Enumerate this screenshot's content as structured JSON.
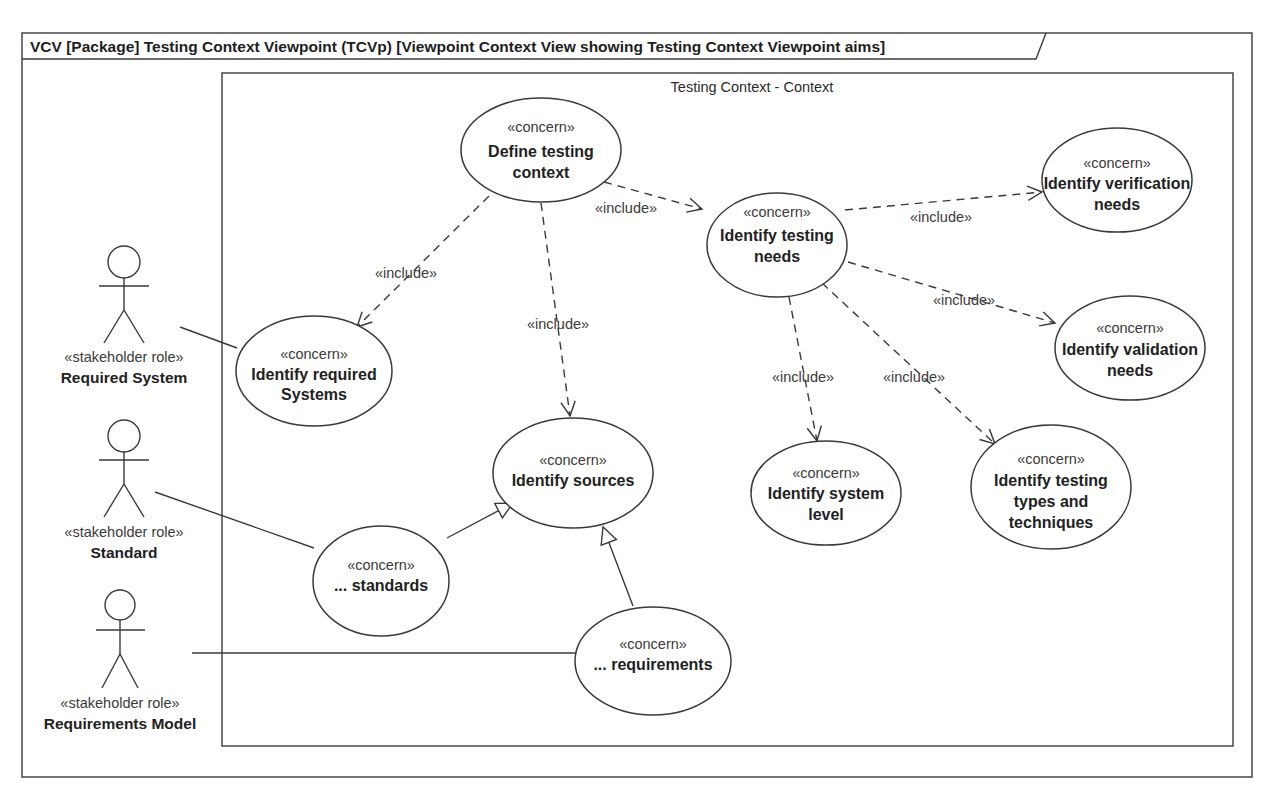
{
  "frame": {
    "title": "VCV [Package] Testing Context Viewpoint (TCVp) [Viewpoint Context View showing Testing Context Viewpoint aims]"
  },
  "boundary": {
    "title": "Testing Context - Context"
  },
  "stereotypes": {
    "concern": "«concern»",
    "stakeholder_role": "«stakeholder role»",
    "include": "«include»"
  },
  "actors": [
    {
      "id": "required-system",
      "stereotype": "«stakeholder role»",
      "name": "Required System"
    },
    {
      "id": "standard",
      "stereotype": "«stakeholder role»",
      "name": "Standard"
    },
    {
      "id": "requirements-model",
      "stereotype": "«stakeholder role»",
      "name": "Requirements Model"
    }
  ],
  "concerns": [
    {
      "id": "define-testing-context",
      "stereotype": "«concern»",
      "lines": [
        "Define testing",
        "context"
      ]
    },
    {
      "id": "identify-testing-needs",
      "stereotype": "«concern»",
      "lines": [
        "Identify testing",
        "needs"
      ]
    },
    {
      "id": "identify-verification-needs",
      "stereotype": "«concern»",
      "lines": [
        "Identify verification",
        "needs"
      ]
    },
    {
      "id": "identify-validation-needs",
      "stereotype": "«concern»",
      "lines": [
        "Identify validation",
        "needs"
      ]
    },
    {
      "id": "identify-required-systems",
      "stereotype": "«concern»",
      "lines": [
        "Identify required",
        "Systems"
      ]
    },
    {
      "id": "identify-sources",
      "stereotype": "«concern»",
      "lines": [
        "Identify sources"
      ]
    },
    {
      "id": "identify-system-level",
      "stereotype": "«concern»",
      "lines": [
        "Identify system",
        "level"
      ]
    },
    {
      "id": "identify-testing-types",
      "stereotype": "«concern»",
      "lines": [
        "Identify testing",
        "types and",
        "techniques"
      ]
    },
    {
      "id": "standards",
      "stereotype": "«concern»",
      "lines": [
        "... standards"
      ]
    },
    {
      "id": "requirements",
      "stereotype": "«concern»",
      "lines": [
        "... requirements"
      ]
    }
  ],
  "relationships": [
    {
      "type": "include",
      "from": "define-testing-context",
      "to": "identify-testing-needs",
      "label": "«include»"
    },
    {
      "type": "include",
      "from": "define-testing-context",
      "to": "identify-required-systems",
      "label": "«include»"
    },
    {
      "type": "include",
      "from": "define-testing-context",
      "to": "identify-sources",
      "label": "«include»"
    },
    {
      "type": "include",
      "from": "identify-testing-needs",
      "to": "identify-verification-needs",
      "label": "«include»"
    },
    {
      "type": "include",
      "from": "identify-testing-needs",
      "to": "identify-validation-needs",
      "label": "«include»"
    },
    {
      "type": "include",
      "from": "identify-testing-needs",
      "to": "identify-system-level",
      "label": "«include»"
    },
    {
      "type": "include",
      "from": "identify-testing-needs",
      "to": "identify-testing-types",
      "label": "«include»"
    },
    {
      "type": "generalization",
      "from": "standards",
      "to": "identify-sources"
    },
    {
      "type": "generalization",
      "from": "requirements",
      "to": "identify-sources"
    },
    {
      "type": "association",
      "from": "required-system",
      "to": "identify-required-systems"
    },
    {
      "type": "association",
      "from": "standard",
      "to": "standards"
    },
    {
      "type": "association",
      "from": "requirements-model",
      "to": "requirements"
    }
  ]
}
